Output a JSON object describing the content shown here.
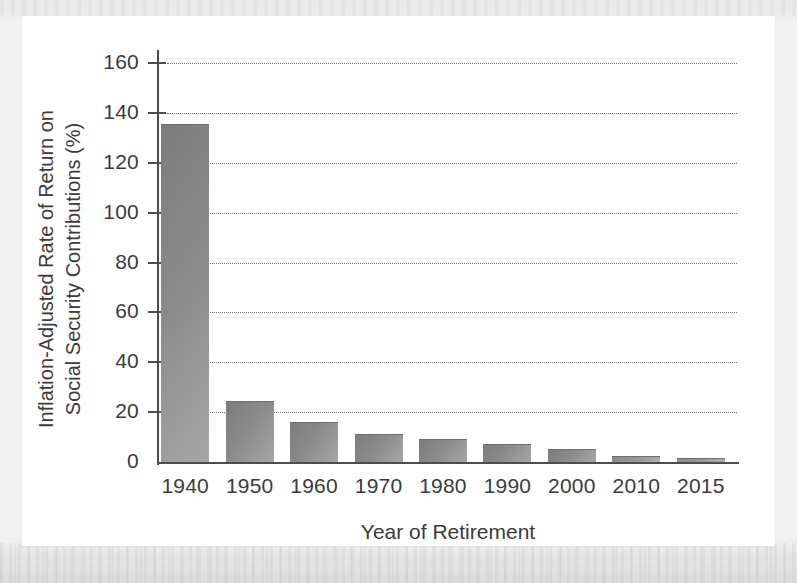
{
  "figure": {
    "background_color": "#ffffff",
    "margin_color": "#ededed",
    "bar_color": "#8a8a8a",
    "axis_color": "#4d4d4d",
    "grid_color": "#6e6e6e"
  },
  "chart_data": {
    "type": "bar",
    "title": "",
    "xlabel": "Year of Retirement",
    "ylabel_line1": "Inflation-Adjusted Rate of Return on",
    "ylabel_line2": "Social Security Contributions (%)",
    "ylabel": "Inflation-Adjusted Rate of Return on Social Security Contributions (%)",
    "categories": [
      "1940",
      "1950",
      "1960",
      "1970",
      "1980",
      "1990",
      "2000",
      "2010",
      "2015"
    ],
    "values": [
      135,
      24,
      15.5,
      11,
      9,
      7,
      5,
      2,
      1
    ],
    "ylim": [
      0,
      168
    ],
    "yticks": [
      0,
      20,
      40,
      60,
      80,
      100,
      120,
      140,
      160
    ],
    "yticklabels": [
      "0",
      "20",
      "40",
      "60",
      "80",
      "100",
      "120",
      "140",
      "160"
    ],
    "grid": "horizontal-dotted",
    "legend": "none"
  }
}
